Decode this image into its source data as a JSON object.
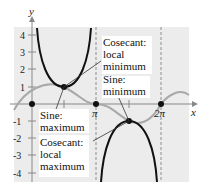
{
  "figure": {
    "axis_labels": {
      "x": "x",
      "y": "y"
    },
    "y_ticks": [
      "4",
      "3",
      "2",
      "1",
      "-1",
      "-2",
      "-3",
      "-4"
    ],
    "x_ticks": [
      "π",
      "2π"
    ],
    "annotations": [
      {
        "id": "csc_min",
        "lines": [
          "Cosecant:",
          "local",
          "minimum"
        ]
      },
      {
        "id": "sin_min",
        "lines": [
          "Sine:",
          "minimum"
        ]
      },
      {
        "id": "sin_max",
        "lines": [
          "Sine:",
          "maximum"
        ]
      },
      {
        "id": "csc_max",
        "lines": [
          "Cosecant:",
          "local",
          "maximum"
        ]
      }
    ],
    "colors": {
      "background": "#ececec",
      "csc_curve": "#111111",
      "sin_curve": "#a8a8a8",
      "axis": "#888888"
    }
  }
}
